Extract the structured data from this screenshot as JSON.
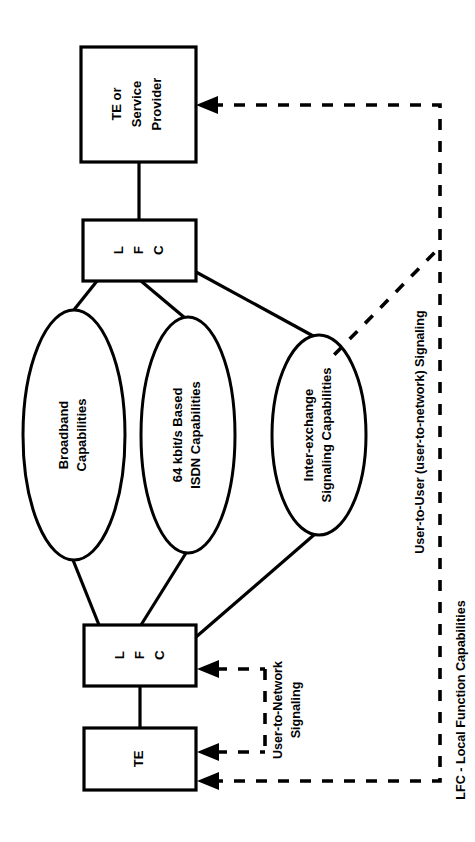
{
  "diagram": {
    "orientation": "rotated-90-ccw",
    "colors": {
      "stroke": "#000000",
      "fill": "#ffffff",
      "background": "#ffffff"
    },
    "nodes": {
      "te_or_service_provider": {
        "label_lines": [
          "TE or",
          "Service",
          "Provider"
        ],
        "shape": "rectangle"
      },
      "lfc_top": {
        "label_lines": [
          "L",
          "F",
          "C"
        ],
        "shape": "rectangle"
      },
      "lfc_bottom": {
        "label_lines": [
          "L",
          "F",
          "C"
        ],
        "shape": "rectangle"
      },
      "te": {
        "label_lines": [
          "TE"
        ],
        "shape": "rectangle"
      },
      "broadband": {
        "label_lines": [
          "Broadband",
          "Capabilities"
        ],
        "shape": "ellipse"
      },
      "isdn": {
        "label_lines": [
          "64 kbit/s Based",
          "ISDN Capabilities"
        ],
        "shape": "ellipse"
      },
      "interexchange": {
        "label_lines": [
          "Inter-exchange",
          "Signaling Capabilities"
        ],
        "shape": "ellipse"
      }
    },
    "annotations": {
      "user_to_network": {
        "label_lines": [
          "User-to-Network",
          "Signaling"
        ],
        "line_style": "dashed",
        "arrowheads": 3
      },
      "user_to_user": {
        "label_lines": [
          "User-to-User (user-to-network) Signaling"
        ],
        "line_style": "dashed",
        "arrowheads": 1
      }
    },
    "legend": {
      "text": "LFC - Local Function Capabilities"
    }
  }
}
